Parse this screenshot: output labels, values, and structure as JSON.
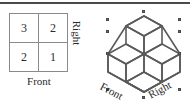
{
  "figure": {
    "top_rule": "horizontal-rule",
    "plan_view": {
      "caption_front": "Front",
      "caption_right": "Right",
      "rows": [
        [
          "3",
          "2"
        ],
        [
          "2",
          "1"
        ]
      ]
    },
    "isometric_view": {
      "caption_front": "Front",
      "caption_right": "Right",
      "shape": "stacked-unit-cubes",
      "selected": true,
      "handle_count": 8
    }
  },
  "colors": {
    "rule": "#4a4a4a",
    "grid_line": "#8a8a8a",
    "text": "#2b2b2b",
    "cube_line": "#5a5a5a",
    "handle_fill": "#6b6b6b",
    "handle_border": "#4a4a4a",
    "background": "#ffffff"
  }
}
